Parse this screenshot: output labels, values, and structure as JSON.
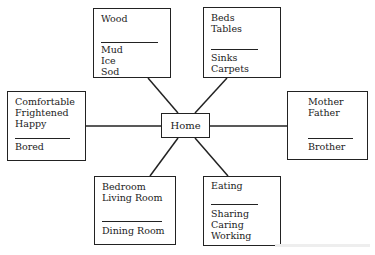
{
  "center": {
    "label": "Home"
  },
  "nodes": {
    "top_left": {
      "above": [
        "Wood"
      ],
      "below": [
        "Mud",
        "Ice",
        "Sod"
      ]
    },
    "top_right": {
      "above": [
        "Beds",
        "Tables"
      ],
      "below": [
        "Sinks",
        "Carpets"
      ]
    },
    "left": {
      "above": [
        "Comfortable",
        "Frightened",
        "Happy"
      ],
      "below": [
        "Bored"
      ]
    },
    "right": {
      "above": [
        "Mother",
        "Father"
      ],
      "below": [
        "Brother"
      ]
    },
    "bottom_left": {
      "above": [
        "Bedroom",
        "Living Room"
      ],
      "below": [
        "Dining Room"
      ]
    },
    "bottom_right": {
      "above": [
        "Eating"
      ],
      "below": [
        "Sharing",
        "Caring",
        "Working"
      ]
    }
  }
}
